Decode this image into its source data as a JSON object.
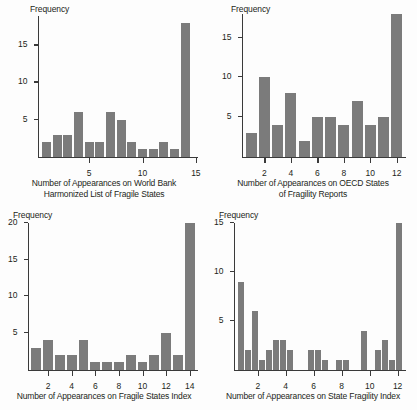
{
  "figure": {
    "background_color": "#fdfdfd",
    "bar_color": "#7b7b7b",
    "axis_color": "#3a3a3a",
    "text_color": "#231f20"
  },
  "chart_data": [
    {
      "id": "world-bank-harmonized",
      "type": "bar",
      "title": "",
      "xlabel": "Number of Appearances on World Bank Harmonized List of Fragile States",
      "xlabel_lines": [
        "Number of Appearances on World Bank",
        "Harmonized List of Fragile States"
      ],
      "ylabel": "Frequency",
      "grid": false,
      "legend": null,
      "xlim": [
        0.2,
        15.2
      ],
      "ylim": [
        0,
        19
      ],
      "xticks": [
        5,
        10,
        15
      ],
      "xtick_labels": [
        "5",
        "10",
        "15"
      ],
      "yticks": [
        5,
        10,
        15
      ],
      "ytick_labels": [
        "5",
        "10",
        "15"
      ],
      "categories": [
        1,
        2,
        3,
        4,
        5,
        6,
        7,
        8,
        9,
        10,
        11,
        12,
        13,
        14
      ],
      "values": [
        2,
        3,
        3,
        6,
        2,
        2,
        6,
        5,
        2,
        1,
        1,
        2,
        1,
        18
      ]
    },
    {
      "id": "oecd-states-of-fragility",
      "type": "bar",
      "title": "",
      "xlabel": "Number of Appearances on OECD States of Fragility Reports",
      "xlabel_lines": [
        "Number of Appearances on OECD States",
        "of Fragility Reports"
      ],
      "ylabel": "Frequency",
      "grid": false,
      "legend": null,
      "xlim": [
        0.3,
        12.7
      ],
      "ylim": [
        0,
        18
      ],
      "xticks": [
        2,
        4,
        6,
        8,
        10,
        12
      ],
      "xtick_labels": [
        "2",
        "4",
        "6",
        "8",
        "10",
        "12"
      ],
      "yticks": [
        5,
        10,
        15
      ],
      "ytick_labels": [
        "5",
        "10",
        "15"
      ],
      "categories": [
        1,
        2,
        3,
        4,
        5,
        6,
        7,
        8,
        9,
        10,
        11,
        12
      ],
      "values": [
        3,
        10,
        4,
        8,
        2,
        5,
        5,
        4,
        7,
        4,
        5,
        18
      ]
    },
    {
      "id": "fragile-states-index",
      "type": "bar",
      "title": "",
      "xlabel": "Number of Appearances on Fragile States Index",
      "xlabel_lines": [
        "Number of Appearances on Fragile States Index"
      ],
      "ylabel": "Frequency",
      "grid": false,
      "legend": null,
      "xlim": [
        0.3,
        14.7
      ],
      "ylim": [
        0,
        20
      ],
      "xticks": [
        2,
        4,
        6,
        8,
        10,
        12,
        14
      ],
      "xtick_labels": [
        "2",
        "4",
        "6",
        "8",
        "10",
        "12",
        "14"
      ],
      "yticks": [
        5,
        10,
        15,
        20
      ],
      "ytick_labels": [
        "5",
        "10",
        "15",
        "20"
      ],
      "categories": [
        1,
        2,
        3,
        4,
        5,
        6,
        7,
        8,
        9,
        10,
        11,
        12,
        13,
        14
      ],
      "values": [
        3,
        4,
        2,
        2,
        4,
        1,
        1,
        1,
        2,
        1,
        2,
        5,
        2,
        20
      ]
    },
    {
      "id": "state-fragility-index",
      "type": "bar",
      "title": "",
      "xlabel": "Number of Appearances on State Fragility Index",
      "xlabel_lines": [
        "Number of Appearances on State Fragility Index"
      ],
      "ylabel": "Frequency",
      "grid": false,
      "legend": null,
      "xlim": [
        0.3,
        12.6
      ],
      "ylim": [
        0,
        15
      ],
      "xticks": [
        2,
        4,
        6,
        8,
        10,
        12
      ],
      "xtick_labels": [
        "2",
        "4",
        "6",
        "8",
        "10",
        "12"
      ],
      "yticks": [
        5,
        10,
        15
      ],
      "ytick_labels": [
        "5",
        "10",
        "15"
      ],
      "categories": [
        0.8,
        1.3,
        1.8,
        2.3,
        2.8,
        3.3,
        3.8,
        4.3,
        4.8,
        5.8,
        6.3,
        6.8,
        7.8,
        8.3,
        9.6,
        10.6,
        11.1,
        11.6,
        12.1
      ],
      "values": [
        9,
        2,
        6,
        1,
        2,
        3,
        3,
        2,
        0,
        2,
        2,
        1,
        1,
        1,
        4,
        2,
        3,
        1,
        15
      ]
    }
  ]
}
